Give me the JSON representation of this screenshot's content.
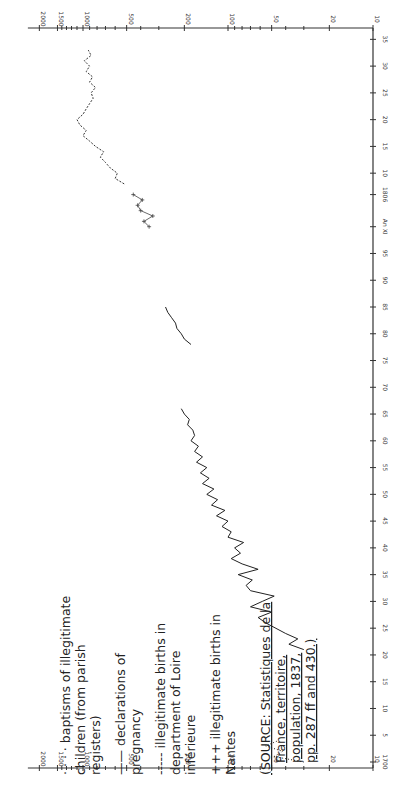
{
  "chart_data": {
    "type": "line",
    "orientation": "rotated-90",
    "title": "",
    "xlabel": "",
    "ylabel": "",
    "y_scale": "log",
    "y_ticks": [
      10,
      20,
      50,
      100,
      200,
      500,
      1000,
      1500,
      2000
    ],
    "y_tick_labels_bottom": [
      "10",
      "20",
      "50",
      "100",
      "200",
      "500",
      "1000",
      "1500",
      "2000"
    ],
    "y_tick_labels_top": [
      "10",
      "20",
      "50",
      "100",
      "200",
      "500",
      "1000",
      "1500",
      "2000"
    ],
    "x_ticks": [
      1700,
      1705,
      1710,
      1715,
      1720,
      1725,
      1730,
      1735,
      1740,
      1745,
      1750,
      1755,
      1760,
      1765,
      1770,
      1775,
      1780,
      1785,
      1790,
      1795,
      1800,
      1806,
      1810,
      1815,
      1820,
      1825,
      1830,
      1835
    ],
    "x_tick_labels": [
      "1700",
      "5",
      "10",
      "15",
      "20",
      "25",
      "30",
      "35",
      "40",
      "45",
      "50",
      "55",
      "60",
      "65",
      "70",
      "75",
      "80",
      "85",
      "90",
      "95",
      "An XI",
      "1806",
      "10",
      "15",
      "20",
      "25",
      "30",
      "35"
    ],
    "xlim": [
      1700,
      1836
    ],
    "ylim": [
      10,
      2000
    ],
    "grid": false,
    "legend_position": "bottom-left (rotated)",
    "series": [
      {
        "name": "baptisms of illegitimate children (from parish registers)",
        "style": "dotted",
        "points": [
          [
            1700,
            30
          ],
          [
            1701,
            48
          ],
          [
            1702,
            42
          ],
          [
            1703,
            55
          ],
          [
            1704,
            45
          ]
        ]
      },
      {
        "name": "declarations of pregnancy",
        "style": "solid",
        "points": [
          [
            1721,
            30
          ],
          [
            1722,
            38
          ],
          [
            1723,
            33
          ],
          [
            1724,
            40
          ],
          [
            1726,
            55
          ],
          [
            1727,
            62
          ],
          [
            1728,
            50
          ],
          [
            1729,
            70
          ],
          [
            1730,
            58
          ],
          [
            1731,
            48
          ],
          [
            1732,
            70
          ],
          [
            1733,
            75
          ],
          [
            1734,
            68
          ],
          [
            1735,
            85
          ],
          [
            1736,
            62
          ],
          [
            1737,
            80
          ],
          [
            1738,
            95
          ],
          [
            1739,
            82
          ],
          [
            1740,
            90
          ],
          [
            1741,
            78
          ],
          [
            1742,
            100
          ],
          [
            1743,
            95
          ],
          [
            1744,
            110
          ],
          [
            1745,
            100
          ],
          [
            1746,
            120
          ],
          [
            1747,
            105
          ],
          [
            1748,
            130
          ],
          [
            1749,
            118
          ],
          [
            1750,
            140
          ],
          [
            1751,
            125
          ],
          [
            1752,
            150
          ],
          [
            1753,
            135
          ],
          [
            1754,
            155
          ],
          [
            1755,
            140
          ],
          [
            1756,
            165
          ],
          [
            1757,
            150
          ],
          [
            1758,
            170
          ],
          [
            1759,
            160
          ],
          [
            1760,
            180
          ],
          [
            1761,
            170
          ],
          [
            1762,
            175
          ],
          [
            1763,
            190
          ],
          [
            1764,
            185
          ],
          [
            1765,
            200
          ],
          [
            1766,
            210
          ],
          [
            1778,
            180
          ],
          [
            1779,
            200
          ],
          [
            1780,
            210
          ],
          [
            1781,
            225
          ],
          [
            1782,
            230
          ],
          [
            1783,
            245
          ],
          [
            1784,
            260
          ],
          [
            1785,
            270
          ]
        ]
      },
      {
        "name": "illegitimate births in department of Loire inférieure",
        "style": "dashed",
        "points": [
          [
            1808,
            520
          ],
          [
            1809,
            600
          ],
          [
            1810,
            580
          ],
          [
            1811,
            650
          ],
          [
            1812,
            700
          ],
          [
            1813,
            760
          ],
          [
            1814,
            720
          ],
          [
            1815,
            820
          ],
          [
            1816,
            900
          ],
          [
            1817,
            1000
          ],
          [
            1818,
            950
          ],
          [
            1819,
            1050
          ],
          [
            1820,
            1100
          ],
          [
            1821,
            1000
          ],
          [
            1822,
            950
          ],
          [
            1823,
            900
          ],
          [
            1824,
            850
          ],
          [
            1825,
            880
          ],
          [
            1826,
            820
          ],
          [
            1827,
            900
          ],
          [
            1828,
            860
          ],
          [
            1829,
            950
          ],
          [
            1830,
            900
          ],
          [
            1831,
            980
          ],
          [
            1832,
            880
          ],
          [
            1833,
            920
          ]
        ]
      },
      {
        "name": "illegitimate births in Nantes",
        "style": "crosses",
        "points": [
          [
            1800,
            350
          ],
          [
            1801,
            380
          ],
          [
            1802,
            330
          ],
          [
            1803,
            400
          ],
          [
            1804,
            420
          ],
          [
            1805,
            390
          ],
          [
            1806,
            450
          ]
        ]
      }
    ]
  },
  "legend": {
    "items": [
      {
        "marker": "· · · ·",
        "lines": [
          "baptisms of illegitimate",
          "children (from parish",
          "registers)"
        ]
      },
      {
        "marker": "——",
        "lines": [
          "declarations of",
          "pregnancy"
        ]
      },
      {
        "marker": "-----",
        "lines": [
          "illegitimate births in",
          "department of Loire",
          "inférieure"
        ]
      },
      {
        "marker": "+++",
        "lines": [
          "illegitimate births in",
          "Nantes"
        ]
      }
    ],
    "source": {
      "lines": [
        "(SOURCE: Statistiques de la",
        "France, territoire,",
        "population, 1837,",
        "pp. 287 ff and 430.)"
      ]
    }
  }
}
